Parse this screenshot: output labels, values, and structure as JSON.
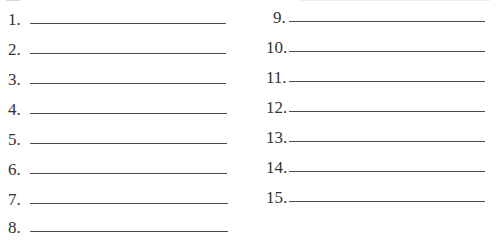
{
  "worksheet": {
    "left_column": {
      "items": [
        {
          "number": "1.",
          "answer": ""
        },
        {
          "number": "2.",
          "answer": ""
        },
        {
          "number": "3.",
          "answer": ""
        },
        {
          "number": "4.",
          "answer": ""
        },
        {
          "number": "5.",
          "answer": ""
        },
        {
          "number": "6.",
          "answer": ""
        },
        {
          "number": "7.",
          "answer": ""
        },
        {
          "number": "8.",
          "answer": ""
        }
      ]
    },
    "right_column": {
      "items": [
        {
          "number": "9.",
          "answer": ""
        },
        {
          "number": "10.",
          "answer": ""
        },
        {
          "number": "11.",
          "answer": ""
        },
        {
          "number": "12.",
          "answer": ""
        },
        {
          "number": "13.",
          "answer": ""
        },
        {
          "number": "14.",
          "answer": ""
        },
        {
          "number": "15.",
          "answer": ""
        }
      ]
    }
  },
  "colors": {
    "background": "#ffffff",
    "text": "#333333",
    "line": "#4a4a4a"
  }
}
